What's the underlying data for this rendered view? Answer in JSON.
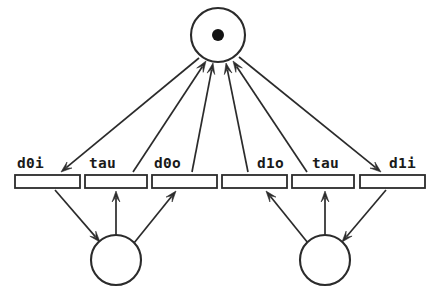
{
  "diagram": {
    "canvas": {
      "width": 440,
      "height": 298
    },
    "colors": {
      "stroke": "#2b2b2b",
      "token": "#131313",
      "background": "#ffffff",
      "label_text": "#1a1a1a"
    }
  },
  "places": [
    {
      "id": "p-top",
      "name": "top-place",
      "cx": 218,
      "cy": 35,
      "r": 27,
      "tokens": 1,
      "token_r": 6
    },
    {
      "id": "p-left",
      "name": "left-place",
      "cx": 116,
      "cy": 260,
      "r": 25,
      "tokens": 0,
      "token_r": 0
    },
    {
      "id": "p-right",
      "name": "right-place",
      "cx": 325,
      "cy": 260,
      "r": 25,
      "tokens": 0,
      "token_r": 0
    }
  ],
  "transitions": [
    {
      "id": "t0",
      "label": "d0i",
      "x": 15,
      "y": 175,
      "w": 65,
      "h": 13,
      "label_x": 17,
      "label_y": 156
    },
    {
      "id": "t1",
      "label": "tau",
      "x": 85,
      "y": 175,
      "w": 62,
      "h": 13,
      "label_x": 89,
      "label_y": 156
    },
    {
      "id": "t2",
      "label": "d0o",
      "x": 152,
      "y": 175,
      "w": 65,
      "h": 13,
      "label_x": 154,
      "label_y": 156
    },
    {
      "id": "t3",
      "label": "d1o",
      "x": 222,
      "y": 175,
      "w": 65,
      "h": 13,
      "label_x": 257,
      "label_y": 156
    },
    {
      "id": "t4",
      "label": "tau",
      "x": 292,
      "y": 175,
      "w": 62,
      "h": 13,
      "label_x": 312,
      "label_y": 156
    },
    {
      "id": "t5",
      "label": "d1i",
      "x": 360,
      "y": 175,
      "w": 65,
      "h": 13,
      "label_x": 389,
      "label_y": 156
    }
  ],
  "arcs": [
    {
      "id": "a0",
      "name": "arc-top-place-to-d0i",
      "from": "p-top",
      "to": "t0",
      "x1": 199,
      "y1": 58,
      "x2": 61,
      "y2": 172,
      "arrow_at": "end"
    },
    {
      "id": "a1",
      "name": "arc-tau-left-to-top-place",
      "from": "t1",
      "to": "p-top",
      "x1": 133,
      "y1": 172,
      "x2": 206,
      "y2": 61,
      "arrow_at": "end"
    },
    {
      "id": "a2",
      "name": "arc-d0o-to-top-place",
      "from": "t2",
      "to": "p-top",
      "x1": 192,
      "y1": 172,
      "x2": 213,
      "y2": 63,
      "arrow_at": "end"
    },
    {
      "id": "a3",
      "name": "arc-d1o-to-top-place",
      "from": "t3",
      "to": "p-top",
      "x1": 248,
      "y1": 172,
      "x2": 226,
      "y2": 63,
      "arrow_at": "end"
    },
    {
      "id": "a4",
      "name": "arc-tau-right-to-top-place",
      "from": "t4",
      "to": "p-top",
      "x1": 307,
      "y1": 172,
      "x2": 233,
      "y2": 61,
      "arrow_at": "end"
    },
    {
      "id": "a5",
      "name": "arc-top-place-to-d1i",
      "from": "p-top",
      "to": "t5",
      "x1": 239,
      "y1": 57,
      "x2": 381,
      "y2": 172,
      "arrow_at": "end"
    },
    {
      "id": "a6",
      "name": "arc-d0i-to-left-place",
      "from": "t0",
      "to": "p-left",
      "x1": 55,
      "y1": 190,
      "x2": 100,
      "y2": 242,
      "arrow_at": "end"
    },
    {
      "id": "a7",
      "name": "arc-left-place-to-tau",
      "from": "p-left",
      "to": "t1",
      "x1": 116,
      "y1": 235,
      "x2": 116,
      "y2": 191,
      "arrow_at": "end"
    },
    {
      "id": "a8",
      "name": "arc-left-place-to-d0o",
      "from": "p-left",
      "to": "t2",
      "x1": 134,
      "y1": 243,
      "x2": 176,
      "y2": 191,
      "arrow_at": "end"
    },
    {
      "id": "a9",
      "name": "arc-right-place-to-d1o",
      "from": "p-right",
      "to": "t3",
      "x1": 308,
      "y1": 243,
      "x2": 266,
      "y2": 191,
      "arrow_at": "end"
    },
    {
      "id": "a10",
      "name": "arc-right-place-to-tau",
      "from": "p-right",
      "to": "t4",
      "x1": 325,
      "y1": 235,
      "x2": 325,
      "y2": 191,
      "arrow_at": "end"
    },
    {
      "id": "a11",
      "name": "arc-d1i-to-right-place",
      "from": "t5",
      "to": "p-right",
      "x1": 386,
      "y1": 190,
      "x2": 342,
      "y2": 242,
      "arrow_at": "end"
    }
  ]
}
